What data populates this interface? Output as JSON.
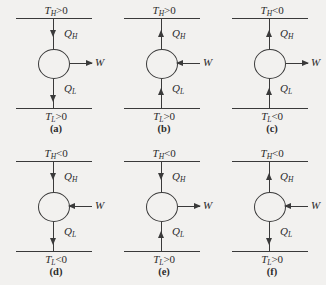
{
  "figure": {
    "background_color": "#f2f1ef",
    "line_color": "#3a3a3a",
    "symbols": {
      "heat_high": "Q",
      "heat_high_sub": "H",
      "heat_low": "Q",
      "heat_low_sub": "L",
      "work": "W",
      "temp": "T",
      "temp_high_sub": "H",
      "temp_low_sub": "L"
    }
  },
  "panels": [
    {
      "id": "a",
      "caption": "(a)",
      "temp_high": {
        "symbol": "T",
        "sub": "H",
        "relation": ">",
        "value": "0"
      },
      "temp_low": {
        "symbol": "T",
        "sub": "L",
        "relation": ">",
        "value": "0"
      },
      "q_high": {
        "label": "Q",
        "sub": "H",
        "direction": "down"
      },
      "q_low": {
        "label": "Q",
        "sub": "L",
        "direction": "down"
      },
      "work": {
        "label": "W",
        "direction": "out"
      }
    },
    {
      "id": "b",
      "caption": "(b)",
      "temp_high": {
        "symbol": "T",
        "sub": "H",
        "relation": ">",
        "value": "0"
      },
      "temp_low": {
        "symbol": "T",
        "sub": "L",
        "relation": ">",
        "value": "0"
      },
      "q_high": {
        "label": "Q",
        "sub": "H",
        "direction": "up"
      },
      "q_low": {
        "label": "Q",
        "sub": "L",
        "direction": "up"
      },
      "work": {
        "label": "W",
        "direction": "in"
      }
    },
    {
      "id": "c",
      "caption": "(c)",
      "temp_high": {
        "symbol": "T",
        "sub": "H",
        "relation": "<",
        "value": "0"
      },
      "temp_low": {
        "symbol": "T",
        "sub": "L",
        "relation": "<",
        "value": "0"
      },
      "q_high": {
        "label": "Q",
        "sub": "H",
        "direction": "up"
      },
      "q_low": {
        "label": "Q",
        "sub": "L",
        "direction": "up"
      },
      "work": {
        "label": "W",
        "direction": "out"
      }
    },
    {
      "id": "d",
      "caption": "(d)",
      "temp_high": {
        "symbol": "T",
        "sub": "H",
        "relation": "<",
        "value": "0"
      },
      "temp_low": {
        "symbol": "T",
        "sub": "L",
        "relation": "<",
        "value": "0"
      },
      "q_high": {
        "label": "Q",
        "sub": "H",
        "direction": "down"
      },
      "q_low": {
        "label": "Q",
        "sub": "L",
        "direction": "down"
      },
      "work": {
        "label": "W",
        "direction": "in"
      }
    },
    {
      "id": "e",
      "caption": "(e)",
      "temp_high": {
        "symbol": "T",
        "sub": "H",
        "relation": "<",
        "value": "0"
      },
      "temp_low": {
        "symbol": "T",
        "sub": "L",
        "relation": ">",
        "value": "0"
      },
      "q_high": {
        "label": "Q",
        "sub": "H",
        "direction": "down"
      },
      "q_low": {
        "label": "Q",
        "sub": "L",
        "direction": "up"
      },
      "work": {
        "label": "W",
        "direction": "out"
      }
    },
    {
      "id": "f",
      "caption": "(f)",
      "temp_high": {
        "symbol": "T",
        "sub": "H",
        "relation": "<",
        "value": "0"
      },
      "temp_low": {
        "symbol": "T",
        "sub": "L",
        "relation": ">",
        "value": "0"
      },
      "q_high": {
        "label": "Q",
        "sub": "H",
        "direction": "up"
      },
      "q_low": {
        "label": "Q",
        "sub": "L",
        "direction": "down"
      },
      "work": {
        "label": "W",
        "direction": "in"
      }
    }
  ]
}
